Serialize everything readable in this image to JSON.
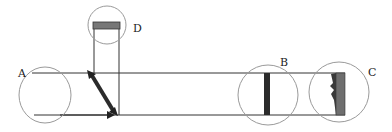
{
  "diagram": {
    "labels": {
      "A": "A",
      "B": "B",
      "C": "C",
      "D": "D"
    },
    "colors": {
      "line": "#333333",
      "circle": "#9a9a9a",
      "bar_dark": "#2b2b2b",
      "bar_gray": "#6e6e6e",
      "bar_d": "#777777"
    }
  }
}
